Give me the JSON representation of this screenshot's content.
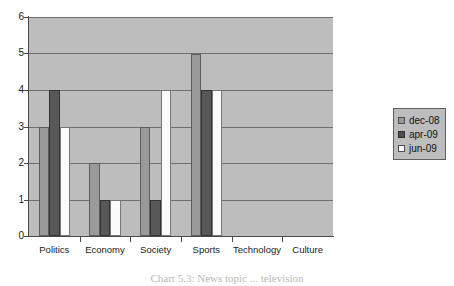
{
  "chart_data": {
    "type": "bar",
    "title": "",
    "xlabel": "",
    "ylabel": "",
    "categories": [
      "Politics",
      "Economy",
      "Society",
      "Sports",
      "Technology",
      "Culture"
    ],
    "series": [
      {
        "name": "dec-08",
        "values": [
          3,
          2,
          3,
          5,
          0,
          0
        ],
        "color": "#9a9a9a"
      },
      {
        "name": "apr-09",
        "values": [
          4,
          1,
          1,
          4,
          0,
          0
        ],
        "color": "#585858"
      },
      {
        "name": "jun-09",
        "values": [
          3,
          1,
          4,
          4,
          0,
          0
        ],
        "color": "#ffffff"
      }
    ],
    "ylim": [
      0,
      6
    ],
    "y_ticks": [
      0,
      1,
      2,
      3,
      4,
      5,
      6
    ],
    "y_tick_labels": [
      "0",
      "1",
      "2",
      "3",
      "4",
      "5",
      "6"
    ],
    "grid": true,
    "grid_axis": "y",
    "legend_position": "right",
    "plot_background": "#bdbdbd"
  },
  "legend": {
    "entries": [
      {
        "label": "dec-08"
      },
      {
        "label": "apr-09"
      },
      {
        "label": "jun-09"
      }
    ]
  },
  "caption": {
    "text": "Chart 5.3: News topic ... television"
  }
}
